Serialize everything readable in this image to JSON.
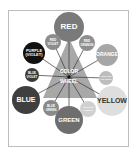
{
  "title": "COLOR WHEEL",
  "center": {
    "line1": "COLOR",
    "line2": "WHEEL"
  },
  "colors": {
    "frame": "#bdbdbd",
    "triangle": "#a8a8a8",
    "spoke": "#333333"
  },
  "circles": [
    {
      "id": "red",
      "label1": "RED",
      "label2": "",
      "cx": 69,
      "cy": 27,
      "r": 15,
      "fill": "#7a7a7a",
      "text": "#ffffff",
      "size": 8
    },
    {
      "id": "red-violet",
      "label1": "RED",
      "label2": "VIOLET",
      "cx": 53,
      "cy": 42,
      "r": 8,
      "fill": "#8c8c8c",
      "text": "#ffffff",
      "size": 3
    },
    {
      "id": "red-orange",
      "label1": "RED",
      "label2": "ORANGE",
      "cx": 87,
      "cy": 43,
      "r": 8,
      "fill": "#8f8f8f",
      "text": "#ffffff",
      "size": 3
    },
    {
      "id": "purple",
      "label1": "PURPLE",
      "label2": "(VIOLET)",
      "cx": 34,
      "cy": 53,
      "r": 11,
      "fill": "#111111",
      "text": "#ffffff",
      "size": 4
    },
    {
      "id": "orange",
      "label1": "ORANGE",
      "label2": "",
      "cx": 107,
      "cy": 55,
      "r": 11,
      "fill": "#a6a6a6",
      "text": "#ffffff",
      "size": 5
    },
    {
      "id": "blue-violet",
      "label1": "BLUE",
      "label2": "VIOLET",
      "cx": 32,
      "cy": 75,
      "r": 7,
      "fill": "#3a3a3a",
      "text": "#ffffff",
      "size": 3
    },
    {
      "id": "yellow-orange",
      "label1": "YELLOW",
      "label2": "ORANGE",
      "cx": 106,
      "cy": 78,
      "r": 7,
      "fill": "#bdbdbd",
      "text": "#ffffff",
      "size": 2.5
    },
    {
      "id": "blue",
      "label1": "BLUE",
      "label2": "",
      "cx": 26,
      "cy": 100,
      "r": 14,
      "fill": "#3f3f3f",
      "text": "#ffffff",
      "size": 7
    },
    {
      "id": "yellow",
      "label1": "YELLOW",
      "label2": "",
      "cx": 112,
      "cy": 101,
      "r": 15,
      "fill": "#dedede",
      "text": "#333333",
      "size": 7
    },
    {
      "id": "blue-green",
      "label1": "BLUE",
      "label2": "GREEN",
      "cx": 51,
      "cy": 108,
      "r": 8,
      "fill": "#8a8a8a",
      "text": "#ffffff",
      "size": 3
    },
    {
      "id": "yellow-green",
      "label1": "YELLOW",
      "label2": "GREEN",
      "cx": 88,
      "cy": 109,
      "r": 8,
      "fill": "#d0d0d0",
      "text": "#ffffff",
      "size": 2.5
    },
    {
      "id": "green",
      "label1": "GREEN",
      "label2": "",
      "cx": 69,
      "cy": 120,
      "r": 14,
      "fill": "#6e6e6e",
      "text": "#ffffff",
      "size": 6
    }
  ]
}
